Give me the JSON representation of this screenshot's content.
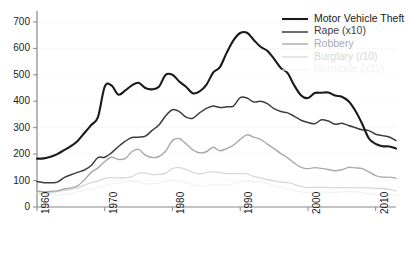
{
  "chart_data": {
    "type": "line",
    "title": "",
    "xlabel": "",
    "ylabel": "",
    "xlim": [
      1960,
      2013
    ],
    "ylim": [
      0,
      730
    ],
    "grid": true,
    "grid_style": "dotted-horizontal",
    "legend_position": "top-right",
    "ytick_labels": [
      "0",
      "100",
      "200",
      "300",
      "400",
      "500",
      "600",
      "700"
    ],
    "ytick_values": [
      0,
      100,
      200,
      300,
      400,
      500,
      600,
      700
    ],
    "xtick_labels": [
      "1960",
      "1970",
      "1980",
      "1990",
      "2000",
      "2010"
    ],
    "xtick_values": [
      1960,
      1970,
      1980,
      1990,
      2000,
      2010
    ],
    "x": [
      1960,
      1961,
      1962,
      1963,
      1964,
      1965,
      1966,
      1967,
      1968,
      1969,
      1970,
      1971,
      1972,
      1973,
      1974,
      1975,
      1976,
      1977,
      1978,
      1979,
      1980,
      1981,
      1982,
      1983,
      1984,
      1985,
      1986,
      1987,
      1988,
      1989,
      1990,
      1991,
      1992,
      1993,
      1994,
      1995,
      1996,
      1997,
      1998,
      1999,
      2000,
      2001,
      2002,
      2003,
      2004,
      2005,
      2006,
      2007,
      2008,
      2009,
      2010,
      2011,
      2012,
      2013
    ],
    "series": [
      {
        "name": "Motor Vehicle Theft",
        "legend_label": "Motor Vehicle Theft",
        "color": "#1a1a1a",
        "width": 2.1,
        "opacity": 1.0,
        "values": [
          183,
          184,
          190,
          200,
          215,
          230,
          250,
          280,
          310,
          340,
          455,
          460,
          425,
          440,
          460,
          470,
          450,
          445,
          455,
          500,
          500,
          475,
          455,
          430,
          437,
          462,
          508,
          529,
          583,
          630,
          658,
          659,
          632,
          606,
          591,
          560,
          526,
          506,
          459,
          422,
          412,
          431,
          432,
          433,
          422,
          417,
          400,
          364,
          315,
          259,
          239,
          230,
          229,
          221
        ]
      },
      {
        "name": "Rape (x10)",
        "legend_label": "Rape (x10)",
        "color": "#3d3d3d",
        "width": 1.5,
        "opacity": 1.0,
        "values": [
          96,
          92,
          92,
          94,
          111,
          122,
          131,
          140,
          157,
          187,
          188,
          205,
          228,
          248,
          263,
          264,
          268,
          290,
          310,
          345,
          368,
          361,
          340,
          336,
          356,
          373,
          382,
          376,
          379,
          382,
          414,
          412,
          397,
          400,
          391,
          372,
          361,
          356,
          343,
          328,
          320,
          315,
          330,
          325,
          313,
          317,
          308,
          300,
          292,
          289,
          275,
          270,
          265,
          251
        ]
      },
      {
        "name": "Robbery",
        "legend_label": "Robbery",
        "color": "#aaaaaa",
        "width": 1.4,
        "opacity": 1.0,
        "values": [
          60,
          58,
          59,
          61,
          68,
          72,
          80,
          103,
          131,
          148,
          172,
          188,
          180,
          183,
          209,
          218,
          196,
          187,
          191,
          212,
          251,
          259,
          239,
          216,
          205,
          209,
          226,
          213,
          221,
          234,
          256,
          273,
          264,
          256,
          238,
          221,
          202,
          186,
          166,
          150,
          145,
          149,
          146,
          142,
          137,
          141,
          150,
          148,
          145,
          133,
          119,
          113,
          113,
          109
        ]
      },
      {
        "name": "Burglary (/10)",
        "legend_label": "Burglary (/10)",
        "color": "#d8d8d8",
        "width": 1.3,
        "opacity": 1.0,
        "values": [
          51,
          52,
          54,
          58,
          63,
          66,
          72,
          83,
          92,
          98,
          108,
          111,
          110,
          110,
          115,
          128,
          128,
          123,
          124,
          128,
          146,
          149,
          142,
          131,
          126,
          130,
          134,
          130,
          127,
          126,
          126,
          125,
          116,
          110,
          104,
          99,
          94,
          92,
          86,
          77,
          73,
          74,
          75,
          74,
          73,
          73,
          73,
          72,
          73,
          72,
          70,
          70,
          67,
          61
        ]
      },
      {
        "name": "Homicide (x10)",
        "legend_label": "Homicide (x10)",
        "color": "#f2f2f2",
        "width": 1.2,
        "opacity": 1.0,
        "values": [
          51,
          48,
          46,
          46,
          49,
          51,
          57,
          63,
          69,
          74,
          79,
          88,
          90,
          94,
          98,
          96,
          88,
          88,
          90,
          97,
          102,
          98,
          92,
          84,
          79,
          80,
          86,
          83,
          84,
          87,
          94,
          98,
          94,
          95,
          90,
          82,
          74,
          68,
          63,
          57,
          55,
          57,
          56,
          56,
          55,
          57,
          58,
          57,
          54,
          50,
          48,
          47,
          47,
          45
        ]
      }
    ]
  },
  "axes": {
    "y_tick_0": "0",
    "y_tick_100": "100",
    "y_tick_200": "200",
    "y_tick_300": "300",
    "y_tick_400": "400",
    "y_tick_500": "500",
    "y_tick_600": "600",
    "y_tick_700": "700",
    "x_tick_1960": "1960",
    "x_tick_1970": "1970",
    "x_tick_1980": "1980",
    "x_tick_1990": "1990",
    "x_tick_2000": "2000",
    "x_tick_2010": "2010"
  }
}
